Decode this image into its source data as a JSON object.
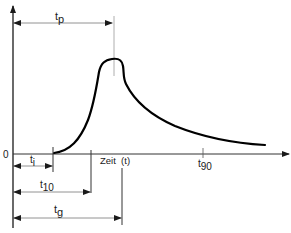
{
  "diagram": {
    "type": "time-response-curve",
    "origin_label": "0",
    "x_axis_label": "Zeit  (t)",
    "labels": {
      "t_p": {
        "base": "t",
        "sub": "p"
      },
      "t_i": {
        "base": "t",
        "sub": "i"
      },
      "t_10": {
        "base": "t",
        "sub": "10"
      },
      "t_g": {
        "base": "t",
        "sub": "g"
      },
      "t_90": {
        "base": "t",
        "sub": "90"
      }
    },
    "colors": {
      "curve": "#000000",
      "axis": "#1a1a1a",
      "guide": "#888888"
    }
  }
}
